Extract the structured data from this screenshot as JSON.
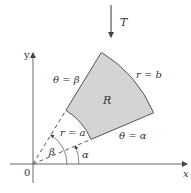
{
  "figure": {
    "labels": {
      "transform": "T",
      "y_axis": "y",
      "x_axis": "x",
      "origin": "0",
      "theta_beta": "θ = β",
      "theta_alpha": "θ = α",
      "r_outer": "r = b",
      "r_inner": "r = a",
      "region": "R",
      "angle_beta": "β",
      "angle_alpha": "α"
    },
    "geometry": {
      "origin": [
        33,
        164
      ],
      "alpha_deg": 23,
      "beta_deg": 58.5,
      "a": 63,
      "b": 131
    },
    "colors": {
      "region_fill": "#d4d4d4",
      "stroke": "#555555",
      "text": "#333333"
    }
  }
}
